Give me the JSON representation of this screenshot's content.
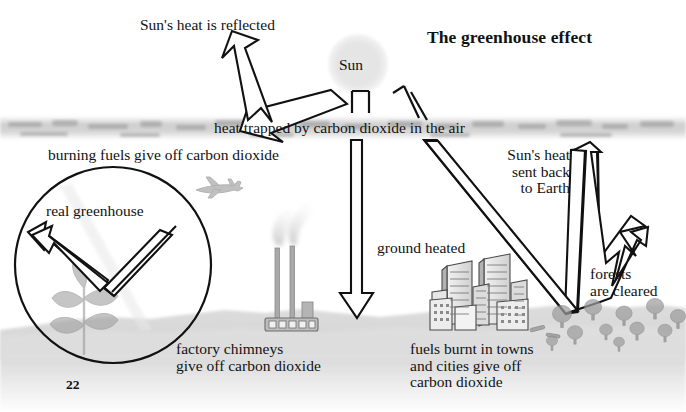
{
  "figure": {
    "title": "The greenhouse effect",
    "page_number": "22"
  },
  "labels": {
    "reflected": "Sun's heat is reflected",
    "sun": "Sun",
    "atmosphere": "heat trapped by carbon dioxide in the air",
    "burning_fuels": "burning fuels give off carbon dioxide",
    "real_greenhouse": "real greenhouse",
    "sent_back": "Sun's heat\nsent back\nto Earth",
    "ground_heated": "ground heated",
    "forests_cleared": "forests\nare cleared",
    "factory": "factory chimneys\ngive off carbon dioxide",
    "towns": "fuels burnt in towns\nand cities give off\ncarbon dioxide"
  },
  "icons": {
    "sun": "sun-disk",
    "airplane": "airplane-icon",
    "factory": "factory-icon",
    "city": "city-buildings-icon",
    "trees": "trees-icon",
    "plant": "plant-icon",
    "atmosphere_band": "atmosphere-band",
    "ground_band": "ground-band"
  },
  "arrows": {
    "reflected": "arrow-reflected-up-left",
    "incoming_down": "arrow-ground-heated-down",
    "sent_back": "arrow-sun-heat-sent-back",
    "greenhouse": "arrow-greenhouse-trapped",
    "trapped_marks": "trapped-heat-marks"
  },
  "colors": {
    "ink": "#111111",
    "sun_fill": "#e3e3e3",
    "haze": "#b9b9b9",
    "ground": "#c9c9c9",
    "paper": "#ffffff"
  }
}
